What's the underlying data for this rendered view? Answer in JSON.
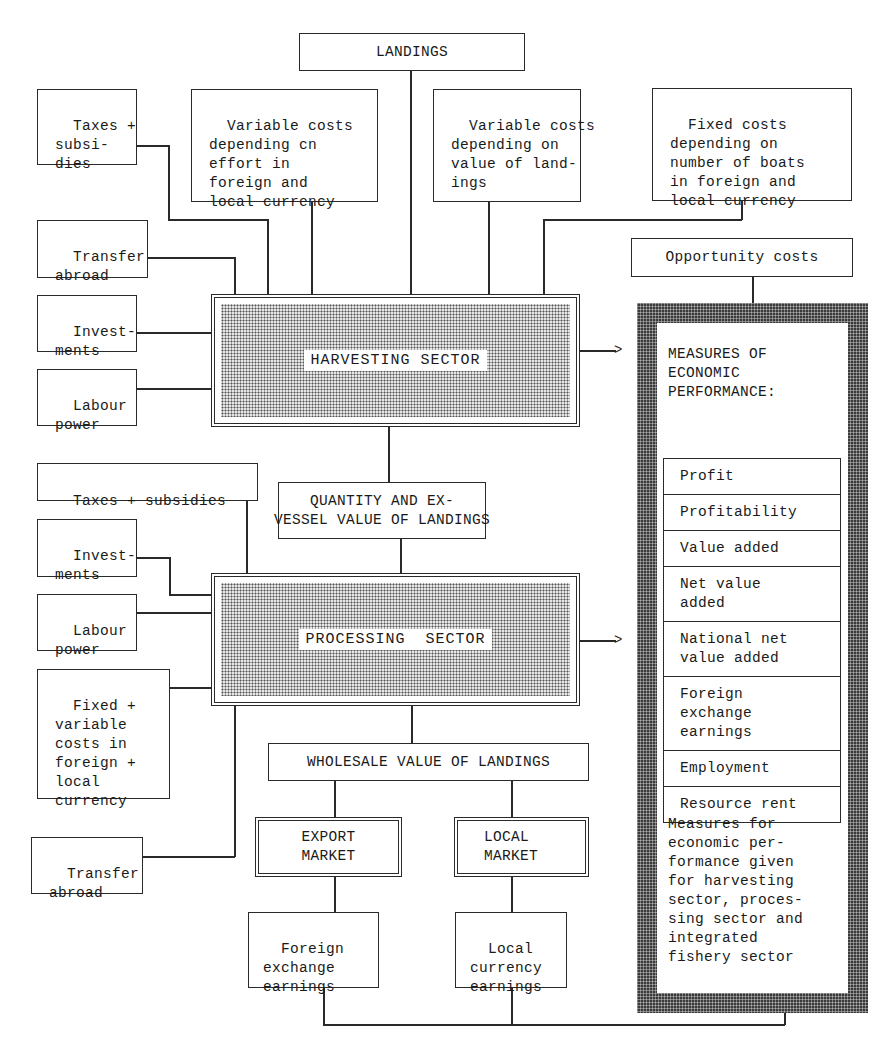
{
  "diagram": {
    "top": {
      "landings": "LANDINGS",
      "taxes_subsidies": "Taxes +\nsubsi-\ndies",
      "variable_costs_effort": "Variable costs\ndepending cn\neffort in\nforeign and\nlocal currency",
      "variable_costs_value": "Variable costs\ndepending on\nvalue of land-\nings",
      "fixed_costs_boats": "Fixed costs\ndepending on\nnumber of boats\nin foreign and\nlocal currency",
      "opportunity_costs": "Opportunity costs"
    },
    "harvesting_inputs": {
      "transfer_abroad": "Transfer\nabroad",
      "investments": "Invest-\nments",
      "labour_power": "Labour\npower"
    },
    "harvesting_sector": "HARVESTING SECTOR",
    "quantity_value": "QUANTITY AND EX-\nVESSEL VALUE OF LANDINGS",
    "processing_inputs": {
      "taxes_subsidies": "Taxes + subsidies",
      "investments": "Invest-\nments",
      "labour_power": "Labour\npower",
      "fixed_variable_costs": "Fixed +\nvariable\ncosts in\nforeign +\nlocal\ncurrency",
      "transfer_abroad": "Transfer\nabroad"
    },
    "processing_sector": "PROCESSING  SECTOR",
    "wholesale_value": "WHOLESALE VALUE OF LANDINGS",
    "markets": {
      "export": "EXPORT\nMARKET",
      "local": "LOCAL\nMARKET"
    },
    "earnings": {
      "foreign": "Foreign\nexchange\nearnings",
      "local": "Local\ncurrency\nearnings"
    },
    "measures": {
      "title": "MEASURES OF\nECONOMIC\nPERFORMANCE:",
      "items": [
        "Profit",
        "Profitability",
        "Value added",
        "Net value\nadded",
        "National net\nvalue added",
        "Foreign\nexchange\nearnings",
        "Employment",
        "Resource rent"
      ],
      "note": "Measures for\neconomic per-\nformance given\nfor harvesting\nsector, proces-\nsing sector and\nintegrated\nfishery sector"
    },
    "arrow_glyph": ">"
  }
}
